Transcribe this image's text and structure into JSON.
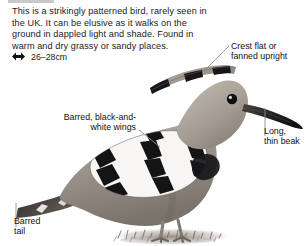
{
  "description": {
    "text": "This is a strikingly patterned bird, rarely seen in the UK. It can be elusive as it walks on the ground in dappled light and shade. Found in warm and dry grassy or sandy places."
  },
  "size": {
    "icon": "double-headed-arrow-icon",
    "value": "26–28cm"
  },
  "illustration": {
    "subject": "hoopoe-bird-photograph",
    "ground": "sandy-ground-shadow"
  },
  "annotations": [
    {
      "id": "crest",
      "text": "Crest flat or\nfanned upright"
    },
    {
      "id": "wings",
      "text": "Barred, black-and-\nwhite wings"
    },
    {
      "id": "beak",
      "text": "Long,\nthin beak"
    },
    {
      "id": "tail",
      "text": "Barred\ntail"
    }
  ],
  "colors": {
    "text": "#1a1a1a",
    "leader_line": "#8c8c8c",
    "rule": "#c9c9c9",
    "background": "#ffffff"
  }
}
